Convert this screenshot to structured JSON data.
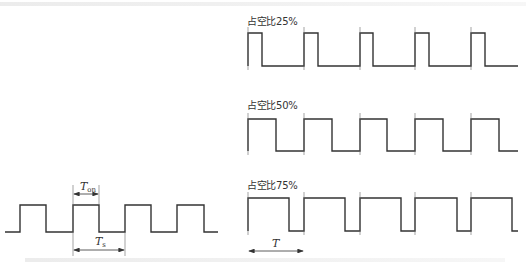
{
  "figure": {
    "top_caption_faded": "",
    "bottom_caption_faded": ""
  },
  "left_diagram": {
    "label_ton": "T",
    "label_ton_sub": "on",
    "label_ts": "T",
    "label_ts_sub": "s"
  },
  "right_diagrams": [
    {
      "label": "占空比25%",
      "duty": 25
    },
    {
      "label": "占空比50%",
      "duty": 50
    },
    {
      "label": "占空比75%",
      "duty": 75
    }
  ],
  "period_label": "T",
  "colors": {
    "line": "#333333",
    "background": "#ffffff"
  }
}
